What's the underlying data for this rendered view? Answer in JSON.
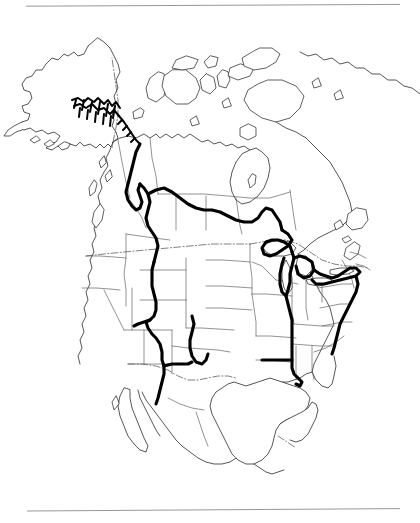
{
  "figure": {
    "domain_kind": "range-map",
    "region": "North America",
    "background_color": "#ffffff",
    "has_caption_text": false,
    "width": 420,
    "height": 523
  },
  "rules": {
    "top": {
      "name": "top-horizontal-rule",
      "color": "#8c8c8c",
      "x_start": 26,
      "x_end": 400,
      "y_start": 6.2,
      "y_end": 4.4,
      "thickness": 0.9
    },
    "bottom": {
      "name": "bottom-horizontal-rule",
      "color": "#8c8c8c",
      "x_start": 27,
      "x_end": 400,
      "y_start": 9.0,
      "y_end": 6.6,
      "thickness": 0.9
    }
  },
  "map": {
    "title": "",
    "projection_hint": "conic",
    "line_colors": {
      "coastline": "#2b2b2b",
      "admin_boundary": "#585858",
      "international_border": "#4a4a4a",
      "range_outline": "#000000"
    },
    "layers": [
      {
        "id": "coastlines",
        "label": "Continental coastlines and islands",
        "visible": true
      },
      {
        "id": "admin",
        "label": "State and province boundaries",
        "visible": true
      },
      {
        "id": "borders",
        "label": "International borders (dash-dot)",
        "visible": true
      },
      {
        "id": "range",
        "label": "Species distribution range outline (bold)",
        "visible": true
      }
    ],
    "range_outline": {
      "style": "bold continuous boundary line",
      "stroke_width_px": 3.1,
      "regions_traced": [
        "Southeast Alaska panhandle coast",
        "British Columbia coast and interior",
        "Canadian Rocky Mountains",
        "Northern Great Plains",
        "Great Lakes: Superior, Michigan, Huron, Erie, Ontario",
        "Appalachian Mountains and Atlantic seaboard",
        "Mississippi River valley to Gulf Coast",
        "Central and southern Rocky Mountains",
        "Sierra Madre Occidental, northern Mexico"
      ]
    },
    "geography": {
      "countries": [
        "Alaska (USA)",
        "Canada",
        "United States",
        "Mexico",
        "Greenland (partial)"
      ],
      "water_bodies": [
        "Hudson Bay",
        "Great Lakes",
        "Gulf of Mexico",
        "Gulf of California"
      ],
      "peninsulas": [
        "Baja California",
        "Florida",
        "Yucatan",
        "Labrador",
        "Alaska Peninsula"
      ]
    }
  }
}
